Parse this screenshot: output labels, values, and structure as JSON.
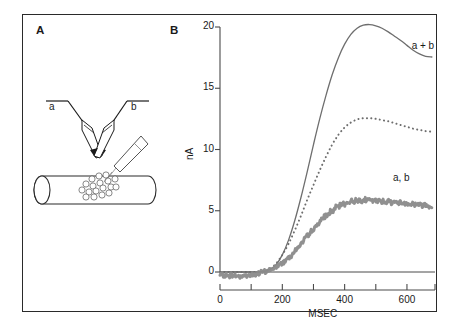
{
  "figure": {
    "panels": [
      {
        "letter": "A",
        "name": "schematic-diagram",
        "electrode_labels": [
          "a",
          "b"
        ]
      },
      {
        "letter": "B",
        "name": "response-chart"
      }
    ]
  },
  "chart_data": {
    "type": "line",
    "title": "",
    "xlabel": "MSEC",
    "ylabel": "nA",
    "xlim": [
      0,
      690
    ],
    "ylim": [
      -1,
      20.6
    ],
    "xticks": [
      0,
      100,
      200,
      300,
      400,
      500,
      600
    ],
    "xticklabels": [
      "0",
      "",
      "200",
      "",
      "400",
      "",
      "600"
    ],
    "yticks": [
      0,
      5,
      10,
      15,
      20
    ],
    "yticklabels": [
      "0",
      "5",
      "10",
      "15",
      "20"
    ],
    "grid": false,
    "legend": "inline-annotations",
    "series": [
      {
        "name": "a + b",
        "label": "a + b",
        "style": "solid",
        "color": "#6e6e6e",
        "x": [
          0,
          20,
          40,
          60,
          80,
          100,
          120,
          140,
          160,
          180,
          200,
          220,
          240,
          260,
          280,
          300,
          320,
          340,
          360,
          380,
          400,
          420,
          440,
          460,
          480,
          500,
          520,
          540,
          560,
          580,
          600,
          620,
          640,
          660,
          680
        ],
        "y": [
          0,
          0,
          0,
          0,
          0,
          0,
          0,
          0.05,
          0.2,
          0.6,
          1.4,
          2.6,
          4.2,
          6.1,
          8.2,
          10.4,
          12.5,
          14.4,
          16.1,
          17.5,
          18.6,
          19.4,
          19.9,
          20.15,
          20.2,
          20.1,
          19.9,
          19.6,
          19.25,
          18.9,
          18.5,
          18.1,
          17.8,
          17.6,
          17.55
        ]
      },
      {
        "name": "dotted-response",
        "label": "",
        "style": "dotted",
        "color": "#6e6e6e",
        "x": [
          0,
          20,
          40,
          60,
          80,
          100,
          120,
          140,
          160,
          180,
          200,
          220,
          240,
          260,
          280,
          300,
          320,
          340,
          360,
          380,
          400,
          420,
          440,
          460,
          480,
          500,
          520,
          540,
          560,
          580,
          600,
          620,
          640,
          660,
          680
        ],
        "y": [
          0,
          0,
          0,
          0,
          0,
          0,
          0,
          0.05,
          0.25,
          0.7,
          1.4,
          2.3,
          3.4,
          4.6,
          5.9,
          7.1,
          8.3,
          9.4,
          10.4,
          11.2,
          11.8,
          12.2,
          12.45,
          12.55,
          12.55,
          12.5,
          12.4,
          12.3,
          12.15,
          12.0,
          11.85,
          11.7,
          11.6,
          11.5,
          11.45
        ]
      },
      {
        "name": "a, b",
        "label": "a, b",
        "style": "noisy-thick",
        "color": "#8a8a8a",
        "x": [
          0,
          20,
          40,
          60,
          80,
          100,
          120,
          140,
          160,
          180,
          200,
          220,
          240,
          260,
          280,
          300,
          320,
          340,
          360,
          380,
          400,
          420,
          440,
          460,
          480,
          500,
          520,
          540,
          560,
          580,
          600,
          620,
          640,
          660,
          680
        ],
        "y": [
          -0.25,
          -0.3,
          -0.25,
          -0.35,
          -0.3,
          -0.25,
          -0.15,
          0.0,
          0.15,
          0.4,
          0.75,
          1.2,
          1.7,
          2.3,
          2.9,
          3.5,
          4.1,
          4.6,
          5.0,
          5.35,
          5.6,
          5.75,
          5.85,
          5.9,
          5.85,
          5.8,
          5.8,
          5.75,
          5.7,
          5.65,
          5.6,
          5.55,
          5.5,
          5.45,
          5.4
        ]
      }
    ],
    "annotations": [
      {
        "text": "a + b",
        "x": 660,
        "y": 18.4
      },
      {
        "text": "a, b",
        "x": 600,
        "y": 7.6
      }
    ]
  },
  "diagram": {
    "name": "dual-electrode-schematic",
    "labels": [
      {
        "text": "a",
        "role": "electrode-a-label"
      },
      {
        "text": "b",
        "role": "electrode-b-label"
      }
    ],
    "elements": [
      "pipette-a",
      "pipette-b",
      "pipette-c",
      "cell-cylinder",
      "receptor-cluster"
    ]
  },
  "colors": {
    "frame": "#2a2a2a",
    "axis": "#4a4a4a",
    "curve_solid": "#6e6e6e",
    "curve_dotted": "#6e6e6e",
    "curve_noisy": "#8a8a8a",
    "text": "#1a1a1a",
    "background": "#ffffff"
  }
}
